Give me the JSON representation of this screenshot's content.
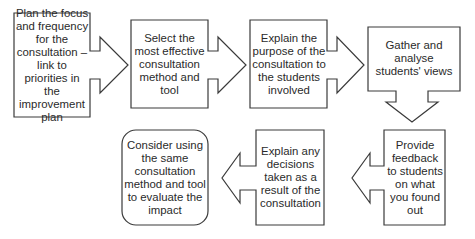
{
  "diagram": {
    "type": "process-flow",
    "steps": [
      {
        "id": 1,
        "shape": "arrow-box-right",
        "text": "Plan the focus and frequency for the consultation – link to priorities in the improvement plan"
      },
      {
        "id": 2,
        "shape": "arrow-box-right",
        "text": "Select the most effective consultation method and tool"
      },
      {
        "id": 3,
        "shape": "arrow-box-right",
        "text": "Explain the purpose of the consultation to the students involved"
      },
      {
        "id": 4,
        "shape": "arrow-box-down",
        "text": "Gather and analyse students' views"
      },
      {
        "id": 5,
        "shape": "arrow-box-left",
        "text": "Provide feedback to students on what you found out"
      },
      {
        "id": 6,
        "shape": "arrow-box-left",
        "text": "Explain any decisions taken as a result of the consultation"
      },
      {
        "id": 7,
        "shape": "rounded-box",
        "text": "Consider using the same consultation method and tool to evaluate the impact"
      }
    ],
    "colors": {
      "stroke": "#3a3a3a",
      "fill": "#ffffff",
      "text": "#2a2a2a"
    }
  }
}
